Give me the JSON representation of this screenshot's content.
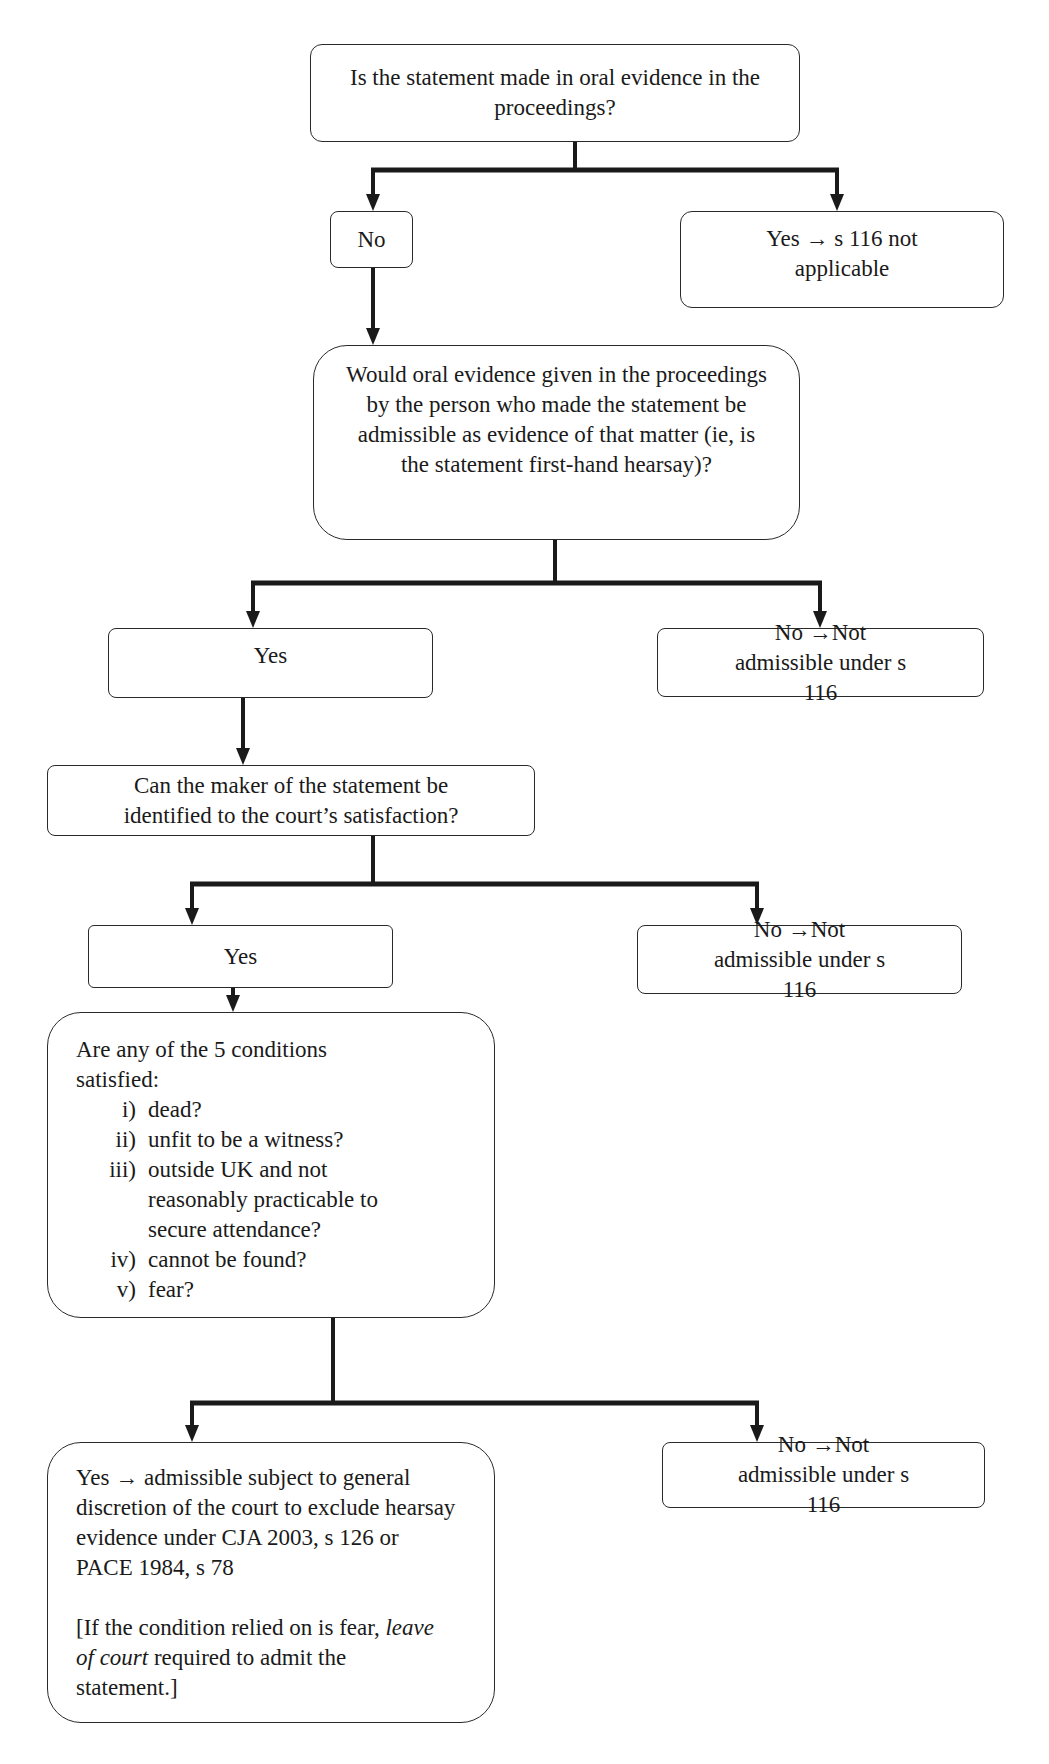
{
  "diagram": {
    "type": "flowchart",
    "nodes": {
      "q1": {
        "text": "Is the statement made in oral evidence in the proceedings?"
      },
      "q1_no": {
        "text": "No"
      },
      "q1_yes": {
        "text": "Yes → s 116 not applicable"
      },
      "q2": {
        "text": "Would oral evidence given in the proceedings by the person who made the statement be admissible as evidence of that matter (ie, is the statement first-hand hearsay)?"
      },
      "q2_yes": {
        "text": "Yes"
      },
      "q2_no": {
        "text": "No →Not admissible under s 116"
      },
      "q3": {
        "text": "Can the maker of the statement be identified to the court’s satisfaction?"
      },
      "q3_yes": {
        "text": "Yes"
      },
      "q3_no": {
        "text": "No →Not admissible under s 116"
      },
      "q4": {
        "intro": "Are any of the 5 conditions satisfied:",
        "conditions": [
          {
            "num": "i)",
            "text": "dead?"
          },
          {
            "num": "ii)",
            "text": "unfit to be a witness?"
          },
          {
            "num": "iii)",
            "text": "outside UK and not reasonably practicable to secure attendance?"
          },
          {
            "num": "iv)",
            "text": "cannot be found?"
          },
          {
            "num": "v)",
            "text": "fear?"
          }
        ]
      },
      "q4_yes": {
        "text": "Yes → admissible subject to general discretion of the court to exclude hearsay evidence under CJA 2003, s 126 or PACE 1984, s 78",
        "note_prefix": "[If the condition relied on is fear, ",
        "note_emphasis": "leave of court",
        "note_suffix": " required to admit the statement.]"
      },
      "q4_no": {
        "text": "No →Not admissible under s 116"
      }
    },
    "edges": [
      {
        "from": "q1",
        "to": "q1_no"
      },
      {
        "from": "q1",
        "to": "q1_yes"
      },
      {
        "from": "q1_no",
        "to": "q2"
      },
      {
        "from": "q2",
        "to": "q2_yes"
      },
      {
        "from": "q2",
        "to": "q2_no"
      },
      {
        "from": "q2_yes",
        "to": "q3"
      },
      {
        "from": "q3",
        "to": "q3_yes"
      },
      {
        "from": "q3",
        "to": "q3_no"
      },
      {
        "from": "q3_yes",
        "to": "q4"
      },
      {
        "from": "q4",
        "to": "q4_yes"
      },
      {
        "from": "q4",
        "to": "q4_no"
      }
    ],
    "colors": {
      "line": "#1a1a1a",
      "border": "#2a2a2a",
      "background": "#ffffff"
    }
  }
}
